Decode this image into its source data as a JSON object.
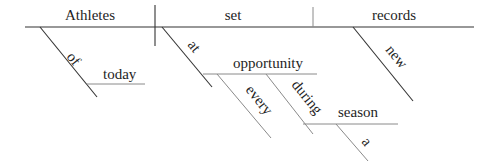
{
  "diagram": {
    "type": "sentence-diagram",
    "sentence": "Athletes of today set new records at every opportunity during a season",
    "baseline": {
      "subject": "Athletes",
      "verb": "set",
      "object": "records"
    },
    "modifiers": {
      "of": "of",
      "today": "today",
      "at": "at",
      "opportunity": "opportunity",
      "every": "every",
      "during": "during",
      "season": "season",
      "a": "a",
      "new": "new"
    },
    "colors": {
      "line": "#333333",
      "text": "#1e1e1e",
      "background": "#ffffff"
    }
  }
}
